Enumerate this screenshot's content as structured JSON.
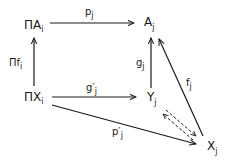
{
  "diagram": {
    "type": "commutative-diagram",
    "nodes": {
      "prod_A": {
        "main": "ΠA",
        "sub": "i"
      },
      "A": {
        "main": "A",
        "sub": "j"
      },
      "prod_X": {
        "main": "ΠX",
        "sub": "i"
      },
      "Y": {
        "main": "Y",
        "sub": "j"
      },
      "X": {
        "main": "X",
        "sub": "j"
      }
    },
    "edges": {
      "p": {
        "main": "p",
        "sub": "j",
        "from": "ΠA_i",
        "to": "A_j",
        "style": "solid"
      },
      "prod_f": {
        "main": "Πf",
        "sub": "i",
        "from": "ΠX_i",
        "to": "ΠA_i",
        "style": "solid"
      },
      "g": {
        "main": "g",
        "sub": "j",
        "from": "Y_j",
        "to": "A_j",
        "style": "solid"
      },
      "g_prime": {
        "main": "g′",
        "sub": "j",
        "from": "ΠX_i",
        "to": "Y_j",
        "style": "solid"
      },
      "f": {
        "main": "f",
        "sub": "j",
        "from": "X_j",
        "to": "A_j",
        "style": "solid"
      },
      "p_prime": {
        "main": "p′",
        "sub": "j",
        "from": "ΠX_i",
        "to": "X_j",
        "style": "solid"
      },
      "dashed_pair": {
        "from": "Y_j",
        "to": "X_j",
        "style": "dashed",
        "direction": "both"
      }
    },
    "colors": {
      "ink": "#1a1a1a",
      "background": "#ffffff"
    }
  }
}
